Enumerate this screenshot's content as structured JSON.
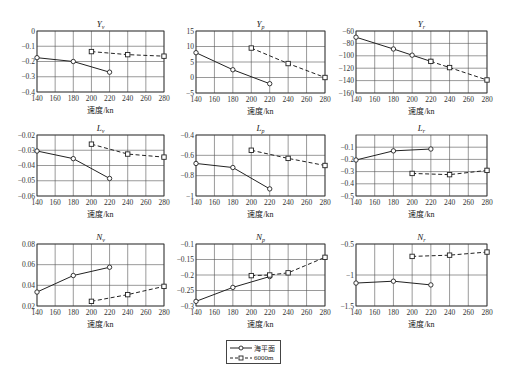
{
  "chart_data": [
    {
      "type": "line",
      "title": "Y",
      "title_sub": "v",
      "xlabel": "速度/kn",
      "ylabel": "",
      "xlim": [
        140,
        280
      ],
      "ylim": [
        -0.4,
        0
      ],
      "xticks": [
        140,
        160,
        180,
        200,
        220,
        240,
        260,
        280
      ],
      "xtick_labels": [
        "140",
        "160",
        "180",
        "200",
        "220",
        "240",
        "260",
        "280"
      ],
      "yticks": [
        0,
        -0.1,
        -0.2,
        -0.3,
        -0.4
      ],
      "ytick_labels": [
        "0",
        "−0.1",
        "−0.2",
        "−0.3",
        "−0.4"
      ],
      "grid": true,
      "series": [
        {
          "name": "海平面",
          "style": "solid",
          "marker": "circle",
          "x": [
            140,
            180,
            220
          ],
          "y": [
            -0.175,
            -0.2,
            -0.27
          ]
        },
        {
          "name": "6000m",
          "style": "dashed",
          "marker": "square",
          "x": [
            200,
            240,
            280
          ],
          "y": [
            -0.135,
            -0.155,
            -0.165
          ]
        }
      ],
      "box": {
        "left": 37,
        "top": 31,
        "right": 164,
        "bottom": 92
      }
    },
    {
      "type": "line",
      "title": "Y",
      "title_sub": "p",
      "xlabel": "速度/kn",
      "ylabel": "",
      "xlim": [
        140,
        280
      ],
      "ylim": [
        -5,
        15
      ],
      "xticks": [
        140,
        160,
        180,
        200,
        220,
        240,
        260,
        280
      ],
      "xtick_labels": [
        "140",
        "160",
        "180",
        "200",
        "220",
        "240",
        "260",
        "280"
      ],
      "yticks": [
        15,
        10,
        5,
        0,
        -5
      ],
      "ytick_labels": [
        "15",
        "10",
        "5",
        "0",
        "−5"
      ],
      "grid": true,
      "series": [
        {
          "name": "海平面",
          "style": "solid",
          "marker": "circle",
          "x": [
            140,
            180,
            220
          ],
          "y": [
            8,
            2.5,
            -2
          ]
        },
        {
          "name": "6000m",
          "style": "dashed",
          "marker": "square",
          "x": [
            200,
            240,
            280
          ],
          "y": [
            9.5,
            4.5,
            0
          ]
        }
      ],
      "box": {
        "left": 196,
        "top": 31,
        "right": 325,
        "bottom": 93
      }
    },
    {
      "type": "line",
      "title": "Y",
      "title_sub": "r",
      "xlabel": "速度/kn",
      "ylabel": "",
      "xlim": [
        140,
        280
      ],
      "ylim": [
        -160,
        -60
      ],
      "xticks": [
        140,
        160,
        180,
        200,
        220,
        240,
        260,
        280
      ],
      "xtick_labels": [
        "140",
        "160",
        "180",
        "200",
        "220",
        "240",
        "260",
        "280"
      ],
      "yticks": [
        -60,
        -80,
        -100,
        -120,
        -140,
        -160
      ],
      "ytick_labels": [
        "−60",
        "−80",
        "−100",
        "−120",
        "−140",
        "−160"
      ],
      "grid": true,
      "series": [
        {
          "name": "海平面",
          "style": "solid",
          "marker": "circle",
          "x": [
            140,
            180,
            200,
            220
          ],
          "y": [
            -70,
            -89,
            -99,
            -109
          ]
        },
        {
          "name": "6000m",
          "style": "dashed",
          "marker": "square",
          "x": [
            220,
            240,
            280
          ],
          "y": [
            -109,
            -119,
            -139
          ]
        }
      ],
      "box": {
        "left": 356,
        "top": 31,
        "right": 487,
        "bottom": 93
      }
    },
    {
      "type": "line",
      "title": "L",
      "title_sub": "v",
      "xlabel": "速度/kn",
      "ylabel": "",
      "xlim": [
        140,
        280
      ],
      "ylim": [
        -0.06,
        -0.02
      ],
      "xticks": [
        140,
        160,
        180,
        200,
        220,
        240,
        260,
        280
      ],
      "xtick_labels": [
        "140",
        "160",
        "180",
        "200",
        "220",
        "240",
        "260",
        "280"
      ],
      "yticks": [
        -0.02,
        -0.03,
        -0.04,
        -0.05,
        -0.06
      ],
      "ytick_labels": [
        "−0.02",
        "−0.03",
        "−0.04",
        "−0.05",
        "−0.06"
      ],
      "grid": true,
      "series": [
        {
          "name": "海平面",
          "style": "solid",
          "marker": "circle",
          "x": [
            140,
            180,
            220
          ],
          "y": [
            -0.0305,
            -0.0355,
            -0.0485
          ]
        },
        {
          "name": "6000m",
          "style": "dashed",
          "marker": "square",
          "x": [
            200,
            240,
            280
          ],
          "y": [
            -0.026,
            -0.0325,
            -0.0345
          ]
        }
      ],
      "box": {
        "left": 37,
        "top": 135,
        "right": 164,
        "bottom": 196
      }
    },
    {
      "type": "line",
      "title": "L",
      "title_sub": "p",
      "xlabel": "速度/kn",
      "ylabel": "",
      "xlim": [
        140,
        280
      ],
      "ylim": [
        -1,
        -0.4
      ],
      "xticks": [
        140,
        160,
        180,
        200,
        220,
        240,
        260,
        280
      ],
      "xtick_labels": [
        "140",
        "160",
        "180",
        "200",
        "220",
        "240",
        "260",
        "280"
      ],
      "yticks": [
        -0.4,
        -0.6,
        -0.8,
        -1
      ],
      "ytick_labels": [
        "−0.4",
        "−0.6",
        "−0.8",
        "−1"
      ],
      "grid": true,
      "series": [
        {
          "name": "海平面",
          "style": "solid",
          "marker": "circle",
          "x": [
            140,
            180,
            220
          ],
          "y": [
            -0.68,
            -0.72,
            -0.93
          ]
        },
        {
          "name": "6000m",
          "style": "dashed",
          "marker": "square",
          "x": [
            200,
            240,
            280
          ],
          "y": [
            -0.55,
            -0.63,
            -0.7
          ]
        }
      ],
      "box": {
        "left": 196,
        "top": 135,
        "right": 325,
        "bottom": 196
      }
    },
    {
      "type": "line",
      "title": "L",
      "title_sub": "r",
      "xlabel": "速度/kn",
      "ylabel": "",
      "xlim": [
        140,
        280
      ],
      "ylim": [
        -0.5,
        0
      ],
      "xticks": [
        140,
        160,
        180,
        200,
        220,
        240,
        260,
        280
      ],
      "xtick_labels": [
        "140",
        "160",
        "180",
        "200",
        "220",
        "240",
        "260",
        "280"
      ],
      "yticks": [
        -0.1,
        -0.2,
        -0.3,
        -0.4,
        -0.5
      ],
      "ytick_labels": [
        "−0.1",
        "−0.2",
        "−0.3",
        "−0.4",
        "−0.5"
      ],
      "grid": true,
      "series": [
        {
          "name": "海平面",
          "style": "solid",
          "marker": "circle",
          "x": [
            140,
            180,
            220
          ],
          "y": [
            -0.205,
            -0.13,
            -0.115
          ]
        },
        {
          "name": "6000m",
          "style": "dashed",
          "marker": "square",
          "x": [
            200,
            240,
            280
          ],
          "y": [
            -0.315,
            -0.325,
            -0.29
          ]
        }
      ],
      "box": {
        "left": 356,
        "top": 135,
        "right": 487,
        "bottom": 196
      }
    },
    {
      "type": "line",
      "title": "N",
      "title_sub": "v",
      "xlabel": "速度/kn",
      "ylabel": "",
      "xlim": [
        140,
        280
      ],
      "ylim": [
        0.02,
        0.08
      ],
      "xticks": [
        140,
        160,
        180,
        200,
        220,
        240,
        260,
        280
      ],
      "xtick_labels": [
        "140",
        "160",
        "180",
        "200",
        "220",
        "240",
        "260",
        "280"
      ],
      "yticks": [
        0.08,
        0.06,
        0.04,
        0.02
      ],
      "ytick_labels": [
        "0.08",
        "0.06",
        "0.04",
        "0.02"
      ],
      "grid": true,
      "series": [
        {
          "name": "海平面",
          "style": "solid",
          "marker": "circle",
          "x": [
            140,
            180,
            220
          ],
          "y": [
            0.0335,
            0.0495,
            0.0575
          ]
        },
        {
          "name": "6000m",
          "style": "dashed",
          "marker": "square",
          "x": [
            200,
            240,
            280
          ],
          "y": [
            0.0245,
            0.031,
            0.039
          ]
        }
      ],
      "box": {
        "left": 37,
        "top": 244,
        "right": 164,
        "bottom": 306
      }
    },
    {
      "type": "line",
      "title": "N",
      "title_sub": "p",
      "xlabel": "速度/kn",
      "ylabel": "",
      "xlim": [
        140,
        280
      ],
      "ylim": [
        -0.3,
        -0.1
      ],
      "xticks": [
        140,
        160,
        180,
        200,
        220,
        240,
        260,
        280
      ],
      "xtick_labels": [
        "140",
        "160",
        "180",
        "200",
        "220",
        "240",
        "260",
        "280"
      ],
      "yticks": [
        -0.1,
        -0.15,
        -0.2,
        -0.25,
        -0.3
      ],
      "ytick_labels": [
        "−0.1",
        "−0.15",
        "−0.2",
        "−0.25",
        "−0.3"
      ],
      "grid": true,
      "series": [
        {
          "name": "海平面",
          "style": "solid",
          "marker": "circle",
          "x": [
            140,
            180,
            220
          ],
          "y": [
            -0.285,
            -0.24,
            -0.205
          ]
        },
        {
          "name": "6000m",
          "style": "dashed",
          "marker": "square",
          "x": [
            200,
            220,
            240,
            280
          ],
          "y": [
            -0.202,
            -0.2,
            -0.193,
            -0.143
          ]
        }
      ],
      "box": {
        "left": 196,
        "top": 244,
        "right": 325,
        "bottom": 306
      }
    },
    {
      "type": "line",
      "title": "N",
      "title_sub": "r",
      "xlabel": "速度/kn",
      "ylabel": "",
      "xlim": [
        140,
        280
      ],
      "ylim": [
        -1.5,
        -0.5
      ],
      "xticks": [
        140,
        160,
        180,
        200,
        220,
        240,
        260,
        280
      ],
      "xtick_labels": [
        "140",
        "160",
        "180",
        "200",
        "220",
        "240",
        "260",
        "280"
      ],
      "yticks": [
        -0.5,
        -1,
        -1.5
      ],
      "ytick_labels": [
        "−0.5",
        "−1",
        "−1.5"
      ],
      "grid": true,
      "series": [
        {
          "name": "海平面",
          "style": "solid",
          "marker": "circle",
          "x": [
            140,
            180,
            220
          ],
          "y": [
            -1.13,
            -1.1,
            -1.16
          ]
        },
        {
          "name": "6000m",
          "style": "dashed",
          "marker": "square",
          "x": [
            200,
            240,
            280
          ],
          "y": [
            -0.7,
            -0.68,
            -0.63
          ]
        }
      ],
      "box": {
        "left": 356,
        "top": 244,
        "right": 487,
        "bottom": 306
      }
    }
  ],
  "legend": {
    "position": "bottom-center",
    "entries": [
      {
        "label": "海平面",
        "style": "solid",
        "marker": "circle"
      },
      {
        "label": "6000m",
        "style": "dashed",
        "marker": "square"
      }
    ]
  },
  "colors": {
    "line": "#222222",
    "grid": "#555555",
    "axis": "#333333",
    "background": "#ffffff"
  }
}
